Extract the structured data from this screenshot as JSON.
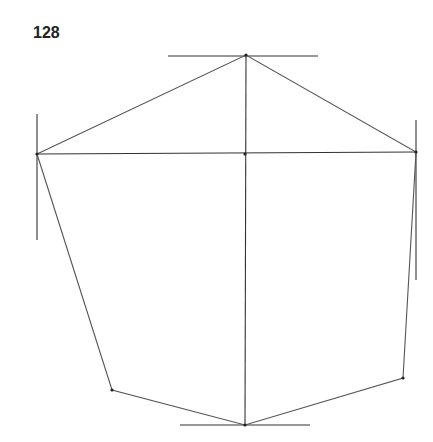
{
  "page_number": "128",
  "drawing": {
    "stroke_color": "#555555",
    "guide_color": "#333333",
    "vertices": {
      "top": [
        246,
        55
      ],
      "left": [
        37,
        154
      ],
      "right": [
        416,
        152
      ],
      "bottom_left": [
        112,
        390
      ],
      "bottom_right": [
        403,
        378
      ],
      "bottom": [
        245,
        425
      ],
      "center": [
        245,
        154
      ]
    },
    "guides": [
      {
        "name": "top-horizontal-guide",
        "from": [
          168,
          56
        ],
        "to": [
          318,
          56
        ]
      },
      {
        "name": "bottom-horizontal-guide",
        "from": [
          180,
          425
        ],
        "to": [
          310,
          425
        ]
      },
      {
        "name": "left-vertical-guide",
        "from": [
          37,
          114
        ],
        "to": [
          37,
          240
        ]
      },
      {
        "name": "right-vertical-guide",
        "from": [
          416,
          120
        ],
        "to": [
          416,
          280
        ]
      },
      {
        "name": "central-vertical-axis",
        "from": [
          246,
          55
        ],
        "to": [
          245,
          425
        ]
      },
      {
        "name": "horizontal-axis",
        "from": [
          37,
          154
        ],
        "to": [
          416,
          152
        ]
      }
    ],
    "outline": [
      [
        37,
        154
      ],
      [
        246,
        55
      ],
      [
        416,
        152
      ],
      [
        403,
        378
      ],
      [
        245,
        425
      ],
      [
        112,
        390
      ],
      [
        37,
        154
      ]
    ]
  }
}
